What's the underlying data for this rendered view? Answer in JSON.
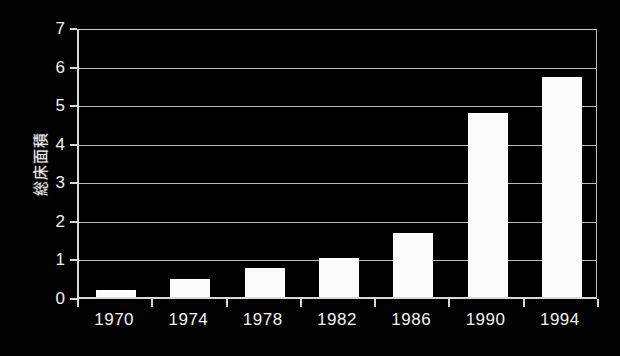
{
  "chart_data": {
    "type": "bar",
    "title": "",
    "xlabel": "",
    "ylabel": "総床面積",
    "categories": [
      "1970",
      "1974",
      "1978",
      "1982",
      "1986",
      "1990",
      "1994"
    ],
    "values": [
      0.17,
      0.47,
      0.76,
      1.0,
      1.66,
      4.78,
      5.7
    ],
    "ylim": [
      0,
      7
    ],
    "ytick_labels": [
      "0",
      "1",
      "2",
      "3",
      "4",
      "5",
      "6",
      "7"
    ],
    "ytick_values": [
      0,
      1,
      2,
      3,
      4,
      5,
      6,
      7
    ],
    "grid": "horizontal",
    "legend": "none",
    "series": [
      {
        "name": "総床面積",
        "values": [
          0.17,
          0.47,
          0.76,
          1.0,
          1.66,
          4.78,
          5.7
        ]
      }
    ],
    "colors": {
      "background": "#000000",
      "bar_fill": "#ffffff",
      "gridline": "#b9b9b9",
      "axis": "#d8d8d8",
      "text": "#f2f2f2"
    }
  }
}
